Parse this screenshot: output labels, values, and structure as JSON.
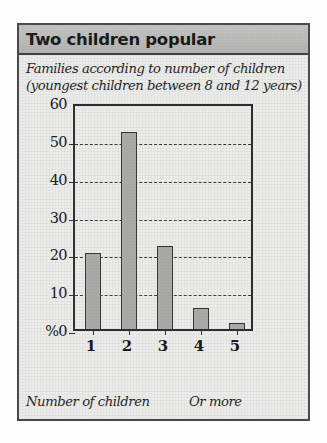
{
  "card": {
    "title": "Two children popular",
    "subtitle_lines": [
      "Families according to number of children",
      "(youngest children between 8 and 12 years)"
    ],
    "footer_left": "Number of children",
    "footer_right": "Or more"
  },
  "colors": {
    "title_bar_bg": "#bcbcbb",
    "card_bg": "#ececeb",
    "card_border": "#4a4a4a",
    "bar_fill": "#aaaaa9",
    "bar_stroke": "#2e2e2e",
    "axis": "#2b2b2b",
    "gridline": "#363636",
    "text": "#141414"
  },
  "chart_data": {
    "type": "bar",
    "title": "Two children popular",
    "subtitle": "Families according to number of children (youngest children between 8 and 12 years)",
    "categories": [
      "1",
      "2",
      "3",
      "4",
      "5"
    ],
    "values": [
      20,
      52,
      22,
      5.5,
      1.5
    ],
    "xlabel": "Number of children",
    "ylabel": "%",
    "ylim": [
      0,
      60
    ],
    "yticks": [
      0,
      10,
      20,
      30,
      40,
      50,
      60
    ],
    "ytick_labels": [
      "%0",
      "10",
      "20",
      "30",
      "40",
      "50",
      "60"
    ],
    "gridlines_at": [
      10,
      20,
      30,
      40,
      50
    ],
    "grid": true,
    "legend": false,
    "annotation_right": "Or more",
    "series": [
      {
        "name": "Families (%)",
        "values": [
          20,
          52,
          22,
          5.5,
          1.5
        ]
      }
    ]
  }
}
